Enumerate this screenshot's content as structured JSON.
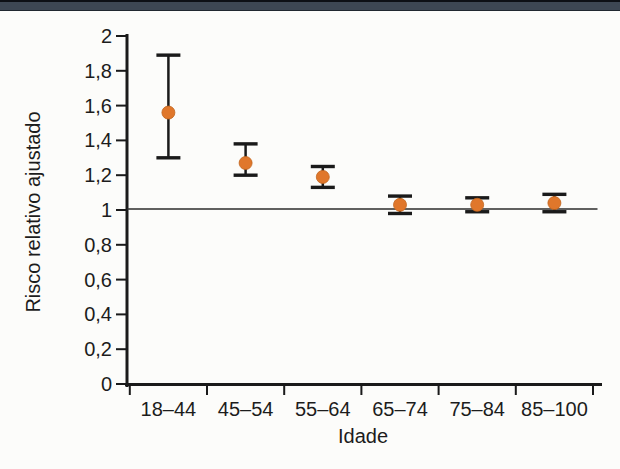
{
  "page": {
    "background": "#fcfcfa",
    "top_bar_color": "#3d4753"
  },
  "chart_data": {
    "type": "scatter",
    "subtype": "point-estimates-with-error-bars",
    "title": "",
    "xlabel": "Idade",
    "ylabel": "Risco relativo ajustado",
    "categories": [
      "18–44",
      "45–54",
      "55–64",
      "65–74",
      "75–84",
      "85–100"
    ],
    "series": [
      {
        "name": "Risco relativo ajustado",
        "values": [
          1.56,
          1.27,
          1.19,
          1.03,
          1.03,
          1.04
        ],
        "ci_low": [
          1.3,
          1.2,
          1.13,
          0.98,
          0.99,
          0.99
        ],
        "ci_high": [
          1.89,
          1.38,
          1.25,
          1.08,
          1.07,
          1.09
        ]
      }
    ],
    "reference_line": 1,
    "ylim": [
      0,
      2
    ],
    "ytick_step": 0.2,
    "ytick_labels": [
      "0",
      "0,2",
      "0,4",
      "0,6",
      "0,8",
      "1",
      "1,2",
      "1,4",
      "1,6",
      "1,8",
      "2"
    ],
    "grid": false,
    "legend": false,
    "decimal_separator": ",",
    "marker_color": "#e0772b",
    "marker_edge_color": "#c2661e",
    "axis_color": "#1a1a1a",
    "reference_line_color": "#3a3a3a"
  }
}
